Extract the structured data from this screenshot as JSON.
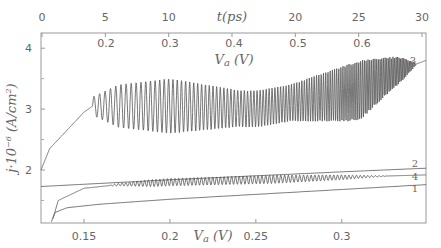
{
  "chart_data": {
    "type": "line",
    "title": "",
    "xlabel": "V_a (V)",
    "ylabel": "j·10^-6 (A/cm^2)",
    "top_axis_label": "t(ps)",
    "inner_top_axis_label": "V_a (V)",
    "xlim": [
      0.125,
      0.349
    ],
    "ylim": [
      1.13,
      4.25
    ],
    "grid": false,
    "legend": "curve numbers at right edge",
    "y_ticks": [
      2,
      3,
      4
    ],
    "x_ticks": [
      0.15,
      0.2,
      0.25,
      0.3
    ],
    "top_t_ticks": [
      0,
      5,
      10,
      15,
      20,
      25,
      30
    ],
    "top_t_tick_labels": [
      "0",
      "5",
      "10",
      "t(ps)",
      "20",
      "25",
      "30"
    ],
    "inner_va_ticks": [
      "0.2",
      "0.3",
      "0.4",
      "0.5",
      "0.6"
    ],
    "series": [
      {
        "name": "1",
        "description": "smooth monotonic lower curve",
        "x": [
          0.131,
          0.133,
          0.14,
          0.16,
          0.2,
          0.25,
          0.3,
          0.349
        ],
        "y": [
          1.15,
          1.3,
          1.38,
          1.44,
          1.52,
          1.6,
          1.68,
          1.76
        ]
      },
      {
        "name": "2",
        "description": "straight line, top of lower group",
        "x": [
          0.125,
          0.2,
          0.3,
          0.349
        ],
        "y": [
          1.73,
          1.84,
          1.97,
          2.03
        ]
      },
      {
        "name": "4",
        "description": "curve with small oscillations between ~0.17 and 0.32 V",
        "x": [
          0.132,
          0.135,
          0.15,
          0.17,
          0.2,
          0.25,
          0.3,
          0.349
        ],
        "y": [
          1.2,
          1.5,
          1.7,
          1.76,
          1.8,
          1.84,
          1.88,
          1.92
        ],
        "oscillation_amplitude": 0.07
      },
      {
        "name": "3",
        "description": "rising curve with large oscillations starting ~0.155 V",
        "x": [
          0.125,
          0.13,
          0.14,
          0.15,
          0.155,
          0.2,
          0.25,
          0.3,
          0.31,
          0.33,
          0.349
        ],
        "y": [
          2.0,
          2.35,
          2.65,
          2.95,
          3.05,
          3.05,
          3.0,
          3.25,
          3.3,
          3.6,
          3.8
        ],
        "oscillation_amplitude": [
          0.35,
          0.45,
          0.25,
          0.45,
          0.5,
          0.05
        ]
      }
    ]
  }
}
